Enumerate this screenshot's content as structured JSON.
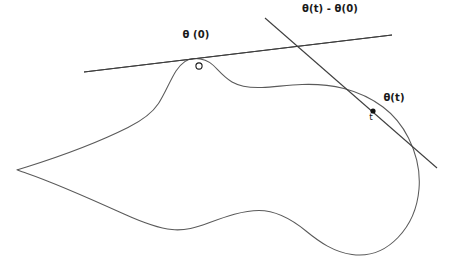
{
  "figure": {
    "background_color": "#ffffff",
    "curve_color": "#5a5a5a",
    "line_color": "#3f3f3f",
    "label_color": "#1a1a1a",
    "width": 458,
    "height": 257
  },
  "labels": {
    "theta_zero": "θ (0)",
    "theta_difference": "θ(t) - θ(0)",
    "theta_t": "θ(t)",
    "t_marker": "t",
    "origin_marker": "o"
  },
  "chart_data": {
    "type": "line",
    "xlabel": "",
    "ylabel": "",
    "grid": false,
    "legend": "none",
    "xlim": [
      0,
      458
    ],
    "ylim": [
      257,
      0
    ],
    "annotations": [
      {
        "text": "θ (0)",
        "x": 196,
        "y": 39,
        "anchor": "middle"
      },
      {
        "text": "θ(t) - θ(0)",
        "x": 330,
        "y": 13,
        "anchor": "middle"
      },
      {
        "text": "θ(t)",
        "x": 394,
        "y": 102,
        "anchor": "middle"
      },
      {
        "text": "t",
        "x": 371,
        "y": 122,
        "anchor": "middle"
      }
    ],
    "series": [
      {
        "name": "closed-curve",
        "kind": "closed-curve",
        "color": "#5a5a5a",
        "path": "M 193.5 58.5 C 186 58.8 181 63.5 176 71 C 170 80.5 165 93.5 158.5 103.5 C 151 115 140 121.5 128 127.5 C 104 139.5 63 155.5 26.5 167 C 22 168.4 18.5 169.2 17 169.8 C 18.5 170.6 22 171.6 26.5 173.2 C 52 182 92 199.5 124 214 C 143 222.6 158 228.2 172 229.6 C 185 230.9 196 227.6 209 222.8 C 226 216.5 243 210.5 259 210.5 C 276.5 210.5 292 219.5 306 231 C 320 242.5 334 252 352 254.5 C 370 257 386 250 398 237.5 C 410 225 417.5 207 419 189 C 420.5 171 416 153 408.5 138 C 402 125 393 114.5 383 107 C 371 98 357.5 92 344 88.5 C 330 85 316 84 302 84.5 C 288 85 274 87 262 87.5 C 250 88 240 86.5 232 82 C 224.5 77.8 219 71 213.5 65.5 C 208 60.2 202 58.2 193.5 58.5 Z"
      },
      {
        "name": "tangent-line-at-theta-zero",
        "kind": "line",
        "color": "#3f3f3f",
        "x1": 84,
        "y1": 72,
        "x2": 392,
        "y2": 35
      },
      {
        "name": "secant-line-theta-t-minus-theta-zero",
        "kind": "line",
        "color": "#3f3f3f",
        "x1": 265,
        "y1": 18,
        "x2": 437,
        "y2": 168
      }
    ],
    "points": [
      {
        "name": "theta-zero-point",
        "x": 199,
        "y": 66,
        "marker": "open-circle",
        "label": "o"
      },
      {
        "name": "theta-t-point",
        "x": 373,
        "y": 111,
        "marker": "filled-dot",
        "label": "t"
      }
    ]
  }
}
